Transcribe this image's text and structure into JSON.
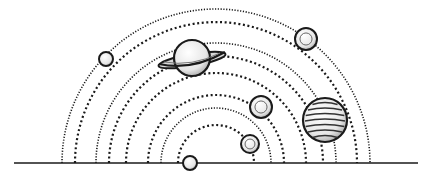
{
  "illustration": {
    "subject": "solar-system-orbits",
    "colors": {
      "background": "#ffffff",
      "ink": "#1a1a1a",
      "planet_fill": "#f2f2f2",
      "shade": "#9a9a9a"
    },
    "baseline": {
      "x1": 14,
      "x2": 418,
      "y": 163
    },
    "center": {
      "x": 216,
      "y": 163
    },
    "orbits": [
      {
        "r": 154,
        "style": "fine"
      },
      {
        "r": 141,
        "style": "dash"
      },
      {
        "r": 120,
        "style": "fine"
      },
      {
        "r": 107,
        "style": "dash"
      },
      {
        "r": 90,
        "style": "dash"
      },
      {
        "r": 68,
        "style": "dash"
      },
      {
        "r": 55,
        "style": "fine"
      },
      {
        "r": 38,
        "style": "dash"
      }
    ],
    "planets": [
      {
        "name": "small-left-planet",
        "cx": 106,
        "cy": 59,
        "r": 7
      },
      {
        "name": "ringed-planet",
        "cx": 192,
        "cy": 58,
        "r": 18
      },
      {
        "name": "top-right-planet",
        "cx": 306,
        "cy": 39,
        "r": 11
      },
      {
        "name": "middle-planet",
        "cx": 261,
        "cy": 107,
        "r": 11
      },
      {
        "name": "banded-planet",
        "cx": 325,
        "cy": 120,
        "r": 22
      },
      {
        "name": "lower-planet",
        "cx": 250,
        "cy": 144,
        "r": 9
      },
      {
        "name": "bottom-planet",
        "cx": 190,
        "cy": 163,
        "r": 7
      }
    ]
  }
}
